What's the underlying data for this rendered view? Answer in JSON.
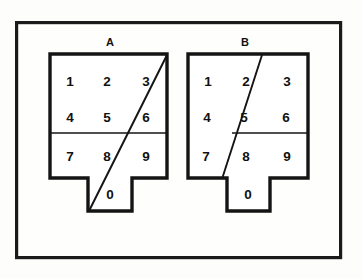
{
  "figure": {
    "title": "",
    "canvas": {
      "width": 362,
      "height": 279,
      "background": "#fdfdfb"
    },
    "frame": {
      "x": 15,
      "y": 21,
      "width": 327,
      "height": 238,
      "stroke": "#1a1a1a"
    },
    "panels": [
      {
        "id": "A",
        "label": "A",
        "label_x": 110,
        "label_y": 43,
        "body": {
          "x": 50,
          "y": 54,
          "width": 117,
          "height": 124
        },
        "notch": {
          "x": 88,
          "y": 178,
          "width": 44,
          "height": 33
        },
        "divider_y": 133,
        "divider_x1": 50,
        "divider_x2": 167,
        "diagonal": {
          "x1": 167,
          "y1": 55,
          "x2": 89,
          "y2": 211
        },
        "keys": [
          {
            "digit": "1",
            "x": 70,
            "y": 82
          },
          {
            "digit": "2",
            "x": 107,
            "y": 82
          },
          {
            "digit": "3",
            "x": 146,
            "y": 82
          },
          {
            "digit": "4",
            "x": 70,
            "y": 118
          },
          {
            "digit": "5",
            "x": 107,
            "y": 118
          },
          {
            "digit": "6",
            "x": 146,
            "y": 118
          },
          {
            "digit": "7",
            "x": 70,
            "y": 157
          },
          {
            "digit": "8",
            "x": 107,
            "y": 157
          },
          {
            "digit": "9",
            "x": 146,
            "y": 157
          },
          {
            "digit": "0",
            "x": 110,
            "y": 195
          }
        ]
      },
      {
        "id": "B",
        "label": "B",
        "label_x": 245,
        "label_y": 43,
        "body": {
          "x": 188,
          "y": 54,
          "width": 120,
          "height": 124
        },
        "notch": {
          "x": 227,
          "y": 178,
          "width": 43,
          "height": 33
        },
        "divider_y": 133,
        "divider_x1": 232,
        "divider_x2": 308,
        "diagonal": {
          "x1": 262,
          "y1": 55,
          "x2": 222,
          "y2": 179
        },
        "keys": [
          {
            "digit": "1",
            "x": 208,
            "y": 82
          },
          {
            "digit": "2",
            "x": 246,
            "y": 82
          },
          {
            "digit": "3",
            "x": 287,
            "y": 82
          },
          {
            "digit": "4",
            "x": 207,
            "y": 118
          },
          {
            "digit": "5",
            "x": 244,
            "y": 118
          },
          {
            "digit": "6",
            "x": 286,
            "y": 118
          },
          {
            "digit": "7",
            "x": 206,
            "y": 157
          },
          {
            "digit": "8",
            "x": 246,
            "y": 157
          },
          {
            "digit": "9",
            "x": 287,
            "y": 157
          },
          {
            "digit": "0",
            "x": 248,
            "y": 195
          }
        ]
      }
    ]
  }
}
